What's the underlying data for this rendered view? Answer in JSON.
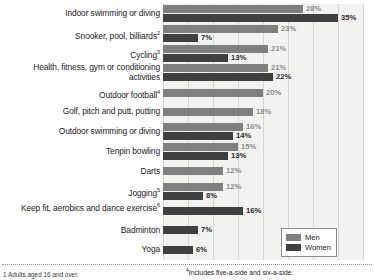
{
  "chart_data": {
    "type": "bar",
    "orientation": "horizontal",
    "title": "",
    "xlabel": "",
    "ylabel": "",
    "xlim": [
      0,
      40
    ],
    "grid": true,
    "gridlines": [
      0,
      5,
      10,
      15,
      20,
      25,
      30,
      35,
      40
    ],
    "legend_position": "bottom-right",
    "value_suffix": "%",
    "categories": [
      "Indoor swimming or diving",
      "Snooker, pool, billiards",
      "Cycling",
      "Health, fitness, gym or conditioning activities",
      "Outdoor football",
      "Golf, pitch and putt, putting",
      "Outdoor swimming or diving",
      "Tenpin bowling",
      "Darts",
      "Jogging",
      "Keep fit, aerobics and dance exercise",
      "Badminton",
      "Yoga"
    ],
    "category_footnote_marks": [
      "",
      "2",
      "3",
      "",
      "4",
      "",
      "",
      "",
      "",
      "5",
      "6",
      "",
      ""
    ],
    "series": [
      {
        "name": "Men",
        "color": "#7f7f7f",
        "values": [
          28,
          23,
          21,
          21,
          20,
          18,
          16,
          15,
          12,
          12,
          null,
          null,
          null
        ]
      },
      {
        "name": "Women",
        "color": "#404040",
        "values": [
          35,
          7,
          13,
          22,
          null,
          null,
          14,
          13,
          null,
          8,
          16,
          7,
          6
        ]
      }
    ],
    "rows": [
      {
        "label": "Indoor swimming or diving",
        "mark": "",
        "bars": [
          {
            "series": "Men",
            "value": 28,
            "label": "28%"
          },
          {
            "series": "Women",
            "value": 35,
            "label": "35%"
          }
        ]
      },
      {
        "label": "Snooker, pool, billiards",
        "mark": "2",
        "bars": [
          {
            "series": "Men",
            "value": 23,
            "label": "23%"
          },
          {
            "series": "Women",
            "value": 7,
            "label": "7%"
          }
        ]
      },
      {
        "label": "Cycling",
        "mark": "3",
        "bars": [
          {
            "series": "Men",
            "value": 21,
            "label": "21%"
          },
          {
            "series": "Women",
            "value": 13,
            "label": "13%"
          }
        ]
      },
      {
        "label": "Health, fitness, gym or conditioning activities",
        "mark": "",
        "bars": [
          {
            "series": "Men",
            "value": 21,
            "label": "21%"
          },
          {
            "series": "Women",
            "value": 22,
            "label": "22%"
          }
        ]
      },
      {
        "label": "Outdoor football",
        "mark": "4",
        "bars": [
          {
            "series": "Men",
            "value": 20,
            "label": "20%"
          }
        ]
      },
      {
        "label": "Golf, pitch and putt, putting",
        "mark": "",
        "bars": [
          {
            "series": "Men",
            "value": 18,
            "label": "18%"
          }
        ]
      },
      {
        "label": "Outdoor swimming or diving",
        "mark": "",
        "bars": [
          {
            "series": "Men",
            "value": 16,
            "label": "16%"
          },
          {
            "series": "Women",
            "value": 14,
            "label": "14%"
          }
        ]
      },
      {
        "label": "Tenpin bowling",
        "mark": "",
        "bars": [
          {
            "series": "Men",
            "value": 15,
            "label": "15%"
          },
          {
            "series": "Women",
            "value": 13,
            "label": "13%"
          }
        ]
      },
      {
        "label": "Darts",
        "mark": "",
        "bars": [
          {
            "series": "Men",
            "value": 12,
            "label": "12%"
          }
        ]
      },
      {
        "label": "Jogging",
        "mark": "5",
        "bars": [
          {
            "series": "Men",
            "value": 12,
            "label": "12%"
          },
          {
            "series": "Women",
            "value": 8,
            "label": "8%"
          }
        ]
      },
      {
        "label": "Keep fit, aerobics and dance exercise",
        "mark": "6",
        "bars": [
          {
            "series": "Women",
            "value": 16,
            "label": "16%"
          }
        ]
      },
      {
        "label": "Badminton",
        "mark": "",
        "bars": [
          {
            "series": "Women",
            "value": 7,
            "label": "7%"
          }
        ]
      },
      {
        "label": "Yoga",
        "mark": "",
        "bars": [
          {
            "series": "Women",
            "value": 6,
            "label": "6%"
          }
        ]
      }
    ]
  },
  "legend": {
    "items": [
      {
        "label": "Men",
        "color": "#7f7f7f"
      },
      {
        "label": "Women",
        "color": "#404040"
      }
    ]
  },
  "footnotes": {
    "left": "1 Adults aged 16 and over.",
    "right_mark": "4",
    "right": "Includes five-a-side and six-a-side."
  },
  "colors": {
    "men": "#7f7f7f",
    "women": "#404040",
    "plot_background": "#f2f2f0",
    "gridline": "#d6d6d2"
  }
}
